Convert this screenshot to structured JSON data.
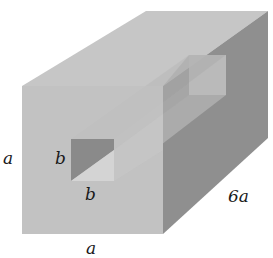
{
  "figure": {
    "type": "diagram",
    "labels": {
      "height": "a",
      "width": "a",
      "length": "6a",
      "hole_height": "b",
      "hole_width": "b"
    },
    "colors": {
      "background": "#ffffff",
      "front_face": "#bdbdbd",
      "top_face": "#c6c6c6",
      "side_face": "#8f8f8f",
      "hole_dark": "#8a8a8a",
      "hole_light": "#d4d4d4",
      "back_hole": "#d0d0d0",
      "label_text": "#1a1a1a"
    }
  }
}
